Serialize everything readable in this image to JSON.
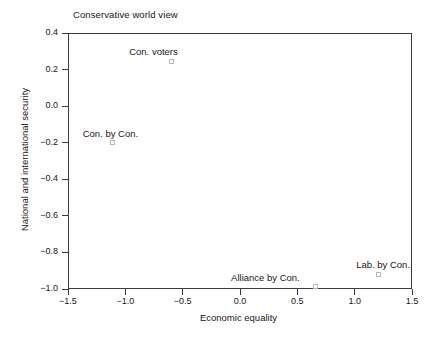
{
  "chart_data": {
    "type": "scatter",
    "title": "Conservative world view",
    "xlabel": "Economic equality",
    "ylabel": "National and international security",
    "xlim": [
      -1.5,
      1.5
    ],
    "ylim": [
      -1.0,
      0.4
    ],
    "xticks": [
      "-1.5",
      "-1.0",
      "-0.5",
      "0.0",
      "0.5",
      "1.0",
      "1.5"
    ],
    "xtick_values": [
      -1.5,
      -1.0,
      -0.5,
      0.0,
      0.5,
      1.0,
      1.5
    ],
    "yticks": [
      "0.4",
      "0.2",
      "0.0",
      "-0.2",
      "-0.4",
      "-0.6",
      "-0.8",
      "-1.0"
    ],
    "ytick_values": [
      0.4,
      0.2,
      0.0,
      -0.2,
      -0.4,
      -0.6,
      -0.8,
      -1.0
    ],
    "grid": false,
    "legend": "none",
    "marker_style": "open-square",
    "marker_color": "#b9b9b9",
    "frame_color": "#3b3b3b",
    "points": [
      {
        "label": "Con. voters",
        "x": -0.6,
        "y": 0.245,
        "label_dx": -42,
        "label_dy": -14
      },
      {
        "label": "Con. by Con.",
        "x": -1.11,
        "y": -0.2,
        "label_dx": -30,
        "label_dy": -14
      },
      {
        "label": "Alliance by Con.",
        "x": 0.655,
        "y": -0.985,
        "label_dx": -84,
        "label_dy": -13
      },
      {
        "label": "Lab. by Con.",
        "x": 1.205,
        "y": -0.92,
        "label_dx": -22,
        "label_dy": -14
      }
    ]
  }
}
